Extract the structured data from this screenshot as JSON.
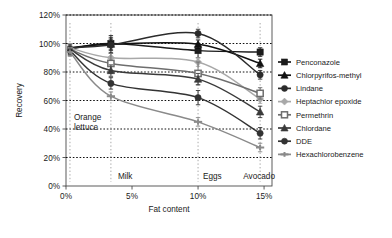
{
  "chart_data": {
    "type": "line",
    "title": "",
    "xlabel": "Fat content",
    "ylabel": "Recovery",
    "xlim": [
      0,
      15.6
    ],
    "ylim": [
      0,
      120
    ],
    "xticks": [
      "0%",
      "5%",
      "10%",
      "15%"
    ],
    "xtick_values": [
      0,
      5,
      10,
      15
    ],
    "yticks": [
      "0%",
      "20%",
      "40%",
      "60%",
      "80%",
      "100%",
      "120%"
    ],
    "ytick_values": [
      0,
      20,
      40,
      60,
      80,
      100,
      120
    ],
    "grid": "horizontal-dotted",
    "legend_position": "right",
    "x": [
      0.3,
      3.4,
      10.0,
      14.7
    ],
    "series": [
      {
        "name": "Penconazole",
        "marker": "square-filled",
        "color": "#1c1c1c",
        "values": [
          96,
          100,
          95,
          94
        ],
        "errors": [
          4,
          4,
          5,
          3
        ]
      },
      {
        "name": "Chlorpyrifos-methyl",
        "marker": "triangle-filled",
        "color": "#111111",
        "values": [
          97,
          99.5,
          99.5,
          86
        ],
        "errors": [
          3,
          6,
          3,
          3
        ]
      },
      {
        "name": "Lindane",
        "marker": "circle-filled",
        "color": "#2b2b2b",
        "values": [
          97,
          99,
          107,
          78
        ],
        "errors": [
          3,
          4,
          3,
          3
        ]
      },
      {
        "name": "Heptachlor epoxide",
        "marker": "diamond-filled",
        "color": "#a8a8a8",
        "values": [
          97,
          90,
          87,
          61
        ],
        "errors": [
          3,
          3,
          3,
          3
        ]
      },
      {
        "name": "Permethrin",
        "marker": "square-open",
        "color": "#6e6e6e",
        "values": [
          96,
          86,
          79,
          65
        ],
        "errors": [
          3,
          7,
          8,
          4
        ]
      },
      {
        "name": "Chlordane",
        "marker": "triangle-filled-2",
        "color": "#3a3a3a",
        "values": [
          96,
          81,
          75,
          52
        ],
        "errors": [
          3,
          4,
          4,
          4
        ]
      },
      {
        "name": "DDE",
        "marker": "circle-filled-2",
        "color": "#333333",
        "values": [
          95,
          72,
          62,
          37
        ],
        "errors": [
          3,
          4,
          5,
          4
        ]
      },
      {
        "name": "Hexachlorobenzene",
        "marker": "plus",
        "color": "#8a8a8a",
        "values": [
          94,
          63,
          45,
          27
        ],
        "errors": [
          3,
          3,
          3,
          3
        ]
      }
    ],
    "annotations": [
      {
        "label": "Orange\nlettuce",
        "x": 0.3,
        "lines": [
          "Orange",
          "lettuce"
        ]
      },
      {
        "label": "Milk",
        "x": 3.4
      },
      {
        "label": "Eggs",
        "x": 10.0
      },
      {
        "label": "Avocado",
        "x": 14.7
      }
    ]
  },
  "legend": {
    "items": [
      {
        "label": "Penconazole"
      },
      {
        "label": "Chlorpyrifos-methyl"
      },
      {
        "label": "Lindane"
      },
      {
        "label": "Heptachlor epoxide"
      },
      {
        "label": "Permethrin"
      },
      {
        "label": "Chlordane"
      },
      {
        "label": "DDE"
      },
      {
        "label": "Hexachlorobenzene"
      }
    ]
  },
  "axis": {
    "ylabel": "Recovery",
    "xlabel": "Fat content"
  },
  "annotation_labels": {
    "orange_1": "Orange",
    "orange_2": "lettuce",
    "milk": "Milk",
    "eggs": "Eggs",
    "avocado": "Avocado"
  }
}
